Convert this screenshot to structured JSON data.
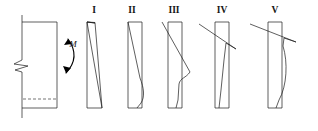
{
  "figure": {
    "background_color": "#ffffff",
    "line_color": "#1a1a1a",
    "width": 318,
    "height": 131
  },
  "section": {
    "name": "member-cross-section",
    "description": "Rectangular member segment with break symbol and neutral axis",
    "outline": {
      "left_x": 22,
      "right_x": 57,
      "top_y": 22,
      "bottom_y": 108
    },
    "axis_line": {
      "x": 22,
      "top_y": 15,
      "bottom_y": 118
    },
    "break_symbol": {
      "label": "break-symbol",
      "center_y": 66
    },
    "neutral_axis": {
      "label": "neutral-axis-dashed-line",
      "y": 99,
      "from_x": 23,
      "to_x": 56,
      "style": "dashed"
    }
  },
  "moment": {
    "label": "M",
    "name": "moment-symbol",
    "label_x": 73,
    "label_y": 47,
    "arc_description": "curved double-headed moment arrow"
  },
  "diagrams": [
    {
      "id": "I",
      "label": "I",
      "name": "stress-diagram-I",
      "stage": "linear elastic, antisymmetric triangular distribution",
      "label_x": 94,
      "label_y": 13,
      "baseline_x": 87,
      "top_y": 22,
      "bottom_y": 108,
      "top_width": 8,
      "bottom_width": 16,
      "profile": "straight diagonal from top-left to bottom-right"
    },
    {
      "id": "II",
      "label": "II",
      "name": "stress-diagram-II",
      "stage": "onset of yielding with curved compression block",
      "label_x": 132,
      "label_y": 13,
      "baseline_x": 128,
      "top_y": 22,
      "bottom_y": 108,
      "top_width": 14,
      "bottom_width": 22,
      "profile": "diagonal with rounded bulge near bottom"
    },
    {
      "id": "III",
      "label": "III",
      "name": "stress-diagram-III",
      "stage": "progressive plasticity, wavy lower profile",
      "label_x": 174,
      "label_y": 13,
      "baseline_x": 168,
      "top_y": 22,
      "bottom_y": 108,
      "top_width": 20,
      "bottom_width": 14,
      "profile": "diagonal crossing axis with S-curve lobe"
    },
    {
      "id": "IV",
      "label": "IV",
      "name": "stress-diagram-IV",
      "stage": "near-ultimate, sharp tension spike",
      "label_x": 222,
      "label_y": 13,
      "baseline_x": 215,
      "top_y": 22,
      "bottom_y": 108,
      "top_width": 30,
      "bottom_width": 12,
      "profile": "narrow wedge spike at top with straight body"
    },
    {
      "id": "V",
      "label": "V",
      "name": "stress-diagram-V",
      "stage": "fully plastic, long spike and curved body",
      "label_x": 275,
      "label_y": 13,
      "baseline_x": 268,
      "top_y": 22,
      "bottom_y": 108,
      "top_width": 44,
      "bottom_width": 10,
      "profile": "long thin spike crossing axis with curved tail"
    }
  ]
}
